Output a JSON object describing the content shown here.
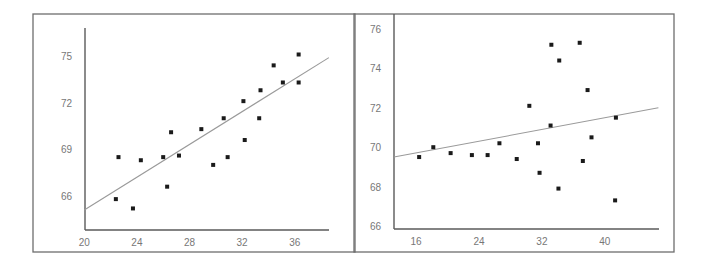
{
  "chart_data": [
    {
      "type": "scatter",
      "title": "",
      "xlabel": "",
      "ylabel": "",
      "xlim": [
        20,
        38.5
      ],
      "ylim": [
        63.7,
        76.8
      ],
      "xticks": [
        20,
        24,
        28,
        32,
        36
      ],
      "yticks": [
        66,
        69,
        72,
        75
      ],
      "grid": false,
      "legend": null,
      "points": [
        {
          "x": 22.4,
          "y": 65.8
        },
        {
          "x": 22.6,
          "y": 68.5
        },
        {
          "x": 23.7,
          "y": 65.2
        },
        {
          "x": 24.3,
          "y": 68.3
        },
        {
          "x": 26.0,
          "y": 68.5
        },
        {
          "x": 26.3,
          "y": 66.6
        },
        {
          "x": 26.6,
          "y": 70.1
        },
        {
          "x": 27.2,
          "y": 68.6
        },
        {
          "x": 28.9,
          "y": 70.3
        },
        {
          "x": 29.8,
          "y": 68.0
        },
        {
          "x": 30.6,
          "y": 71.0
        },
        {
          "x": 30.9,
          "y": 68.5
        },
        {
          "x": 32.1,
          "y": 72.1
        },
        {
          "x": 32.2,
          "y": 69.6
        },
        {
          "x": 33.3,
          "y": 71.0
        },
        {
          "x": 33.4,
          "y": 72.8
        },
        {
          "x": 34.4,
          "y": 74.4
        },
        {
          "x": 35.1,
          "y": 73.3
        },
        {
          "x": 36.3,
          "y": 73.3
        },
        {
          "x": 36.3,
          "y": 75.1
        }
      ],
      "regression_line": {
        "x0": 20,
        "y0": 65.1,
        "x1": 38.6,
        "y1": 74.9
      }
    },
    {
      "type": "scatter",
      "title": "",
      "xlabel": "",
      "ylabel": "",
      "xlim": [
        13.2,
        46.8
      ],
      "ylim": [
        65.8,
        76.2
      ],
      "xticks": [
        16,
        24,
        32,
        40
      ],
      "yticks": [
        66,
        68,
        70,
        72,
        74,
        76
      ],
      "grid": false,
      "legend": null,
      "points": [
        {
          "x": 16.4,
          "y": 69.5
        },
        {
          "x": 18.2,
          "y": 70.0
        },
        {
          "x": 20.4,
          "y": 69.7
        },
        {
          "x": 23.1,
          "y": 69.6
        },
        {
          "x": 25.1,
          "y": 69.6
        },
        {
          "x": 26.6,
          "y": 70.2
        },
        {
          "x": 28.8,
          "y": 69.4
        },
        {
          "x": 30.4,
          "y": 72.1
        },
        {
          "x": 31.5,
          "y": 70.2
        },
        {
          "x": 31.7,
          "y": 68.7
        },
        {
          "x": 33.1,
          "y": 71.1
        },
        {
          "x": 33.2,
          "y": 75.2
        },
        {
          "x": 34.2,
          "y": 74.4
        },
        {
          "x": 34.1,
          "y": 67.9
        },
        {
          "x": 36.8,
          "y": 75.3
        },
        {
          "x": 37.2,
          "y": 69.3
        },
        {
          "x": 37.8,
          "y": 72.9
        },
        {
          "x": 38.3,
          "y": 70.5
        },
        {
          "x": 41.4,
          "y": 71.5
        },
        {
          "x": 41.3,
          "y": 67.3
        }
      ],
      "regression_line": {
        "x0": 13.2,
        "y0": 69.5,
        "x1": 46.8,
        "y1": 72.0
      }
    }
  ],
  "colors": {
    "frame": "#6e6e6e",
    "axis": "#5a5a5a",
    "regression_line": "#9a9a9a",
    "points": "#1a1a1a",
    "tick_labels": "#777777"
  }
}
